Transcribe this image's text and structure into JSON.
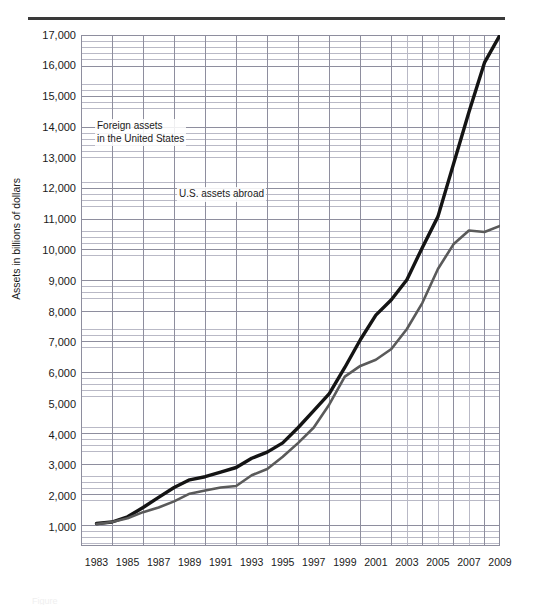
{
  "figure": {
    "y_axis_title": "Assets in billions of dollars",
    "footer_fragment": "Figure"
  },
  "chart_data": {
    "type": "line",
    "title": "",
    "xlabel": "",
    "ylabel": "Assets in billions of dollars",
    "xlim": [
      1982,
      2009
    ],
    "ylim": [
      400,
      17000
    ],
    "grid": true,
    "grid_major_y_step": 1000,
    "grid_minor_y_step": 200,
    "grid_major_x_step": 2,
    "grid_minor_x_step": 1,
    "legend_position": "inline-annotations",
    "x": [
      1983,
      1984,
      1985,
      1986,
      1987,
      1988,
      1989,
      1990,
      1991,
      1992,
      1993,
      1994,
      1995,
      1996,
      1997,
      1998,
      1999,
      2000,
      2001,
      2002,
      2003,
      2004,
      2005,
      2006,
      2007,
      2008,
      2009
    ],
    "ytick_labels": [
      "17,000",
      "16,000",
      "15,000",
      "14,000",
      "13,000",
      "12,000",
      "11,000",
      "10,000",
      "9,000",
      "8,000",
      "7,000",
      "6,000",
      "5,000",
      "4,000",
      "3,000",
      "2,000",
      "1,000"
    ],
    "ytick_values": [
      17000,
      16000,
      15000,
      14000,
      13000,
      12000,
      11000,
      10000,
      9000,
      8000,
      7000,
      6000,
      5000,
      4000,
      3000,
      2000,
      1000
    ],
    "xtick_labels": [
      "1983",
      "1985",
      "1987",
      "1989",
      "1991",
      "1993",
      "1995",
      "1997",
      "1999",
      "2001",
      "2003",
      "2005",
      "2007",
      "2009"
    ],
    "xtick_values": [
      1983,
      1985,
      1987,
      1989,
      1991,
      1993,
      1995,
      1997,
      1999,
      2001,
      2003,
      2005,
      2007,
      2009
    ],
    "series": [
      {
        "name": "Foreign assets in the United States",
        "color": "#141414",
        "width": 3.4,
        "values": [
          1130,
          1180,
          1350,
          1650,
          1980,
          2300,
          2550,
          2650,
          2800,
          2950,
          3250,
          3450,
          3750,
          4250,
          4800,
          5350,
          6200,
          7100,
          7900,
          8400,
          9050,
          10100,
          11100,
          12800,
          14500,
          16100,
          17000
        ]
      },
      {
        "name": "U.S. assets abroad",
        "color": "#5a5a5a",
        "width": 2.6,
        "values": [
          1110,
          1180,
          1300,
          1500,
          1650,
          1850,
          2100,
          2200,
          2300,
          2350,
          2700,
          2900,
          3300,
          3750,
          4250,
          5000,
          5900,
          6250,
          6450,
          6800,
          7450,
          8300,
          9400,
          10200,
          10650,
          10600,
          10800
        ]
      }
    ],
    "annotations": [
      {
        "text": "Foreign assets\nin the United States",
        "series": "Foreign assets in the United States"
      },
      {
        "text": "U.S. assets abroad",
        "series": "U.S. assets abroad"
      }
    ]
  }
}
